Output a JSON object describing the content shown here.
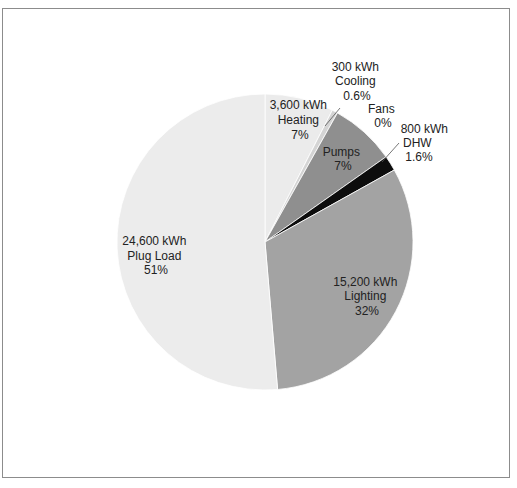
{
  "chart_data": {
    "type": "pie",
    "title": "",
    "unit": "kWh",
    "start_angle_deg": 0,
    "direction": "clockwise",
    "slices": [
      {
        "name": "Heating",
        "value": 3600,
        "value_label": "3,600 kWh",
        "percent_label": "7%",
        "color": "#ebebeb"
      },
      {
        "name": "Cooling",
        "value": 300,
        "value_label": "300 kWh",
        "percent_label": "0.6%",
        "color": "#d4d4d4"
      },
      {
        "name": "Fans",
        "value": 0,
        "value_label": "",
        "percent_label": "0%",
        "color": "#bdbdbd"
      },
      {
        "name": "Pumps",
        "value": 3400,
        "value_label": "",
        "percent_label": "7%",
        "color": "#8f8f8f"
      },
      {
        "name": "DHW",
        "value": 800,
        "value_label": "800 kWh",
        "percent_label": "1.6%",
        "color": "#0d0d0d"
      },
      {
        "name": "Lighting",
        "value": 15200,
        "value_label": "15,200 kWh",
        "percent_label": "32%",
        "color": "#a3a3a3"
      },
      {
        "name": "Plug Load",
        "value": 24600,
        "value_label": "24,600 kWh",
        "percent_label": "51%",
        "color": "#ececec"
      }
    ],
    "legend": "none",
    "grid": false
  },
  "labels": {
    "heating": {
      "l1": "3,600 kWh",
      "l2": "Heating",
      "l3": "7%"
    },
    "cooling": {
      "l1": "300 kWh",
      "l2": "Cooling",
      "l3": "0.6%"
    },
    "fans": {
      "l1": "Fans",
      "l2": "0%"
    },
    "pumps": {
      "l1": "Pumps",
      "l2": "7%"
    },
    "dhw": {
      "l1": "800 kWh",
      "l2": "DHW",
      "l3": "1.6%"
    },
    "lighting": {
      "l1": "15,200 kWh",
      "l2": "Lighting",
      "l3": "32%"
    },
    "plug": {
      "l1": "24,600 kWh",
      "l2": "Plug Load",
      "l3": "51%"
    }
  }
}
